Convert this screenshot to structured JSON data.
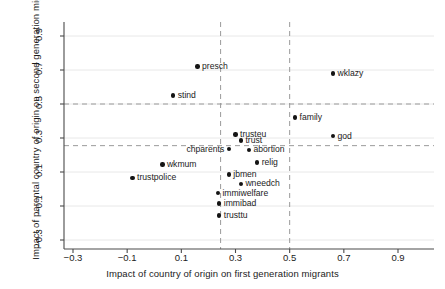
{
  "chart_data": {
    "type": "scatter",
    "title": "",
    "xlabel": "Impact of country of origin on first generation migrants",
    "ylabel": "Impact of parental country of origin on second generation migrants",
    "xlim": [
      -0.36,
      1.0
    ],
    "ylim": [
      -0.34,
      1.0
    ],
    "xticks": [
      "-0.3",
      "-0.1",
      "0.1",
      "0.3",
      "0.5",
      "0.7",
      "0.9"
    ],
    "xtick_values": [
      -0.3,
      -0.1,
      0.1,
      0.3,
      0.5,
      0.7,
      0.9
    ],
    "yticks": [
      "-0.3",
      "-0.1",
      "0.1",
      "0.3",
      "0.5",
      "0.7",
      "0.9"
    ],
    "ytick_values": [
      -0.3,
      -0.1,
      0.1,
      0.3,
      0.5,
      0.7,
      0.9
    ],
    "grid": true,
    "grid_color": "#e8e8e8",
    "legend": "none",
    "point_color": "#141414",
    "reference_lines": [
      {
        "orientation": "vertical",
        "value": 0.245,
        "style": "dashed",
        "color": "#9a9a9a"
      },
      {
        "orientation": "vertical",
        "value": 0.5,
        "style": "dashed",
        "color": "#9a9a9a"
      },
      {
        "orientation": "horizontal",
        "value": 0.5,
        "style": "dashed",
        "color": "#9a9a9a"
      },
      {
        "orientation": "horizontal",
        "value": 0.255,
        "style": "dashed",
        "color": "#9a9a9a"
      }
    ],
    "points": [
      {
        "label": "presch",
        "x": 0.16,
        "y": 0.72,
        "label_side": "right"
      },
      {
        "label": "wklazy",
        "x": 0.66,
        "y": 0.68,
        "label_side": "right"
      },
      {
        "label": "stind",
        "x": 0.07,
        "y": 0.55,
        "label_side": "right"
      },
      {
        "label": "family",
        "x": 0.52,
        "y": 0.42,
        "label_side": "right"
      },
      {
        "label": "trusteu",
        "x": 0.3,
        "y": 0.32,
        "label_side": "right"
      },
      {
        "label": "god",
        "x": 0.66,
        "y": 0.31,
        "label_side": "right"
      },
      {
        "label": "trust",
        "x": 0.32,
        "y": 0.285,
        "label_side": "right"
      },
      {
        "label": "chparents",
        "x": 0.275,
        "y": 0.235,
        "label_side": "left"
      },
      {
        "label": "abortion",
        "x": 0.35,
        "y": 0.23,
        "label_side": "right"
      },
      {
        "label": "relig",
        "x": 0.38,
        "y": 0.155,
        "label_side": "right"
      },
      {
        "label": "wkmum",
        "x": 0.03,
        "y": 0.145,
        "label_side": "right"
      },
      {
        "label": "jbmen",
        "x": 0.275,
        "y": 0.085,
        "label_side": "right"
      },
      {
        "label": "trustpolice",
        "x": -0.08,
        "y": 0.065,
        "label_side": "right"
      },
      {
        "label": "wneedch",
        "x": 0.32,
        "y": 0.03,
        "label_side": "right"
      },
      {
        "label": "immiwelfare",
        "x": 0.235,
        "y": -0.025,
        "label_side": "right"
      },
      {
        "label": "immibad",
        "x": 0.24,
        "y": -0.085,
        "label_side": "right"
      },
      {
        "label": "trusttu",
        "x": 0.24,
        "y": -0.155,
        "label_side": "right"
      }
    ]
  }
}
